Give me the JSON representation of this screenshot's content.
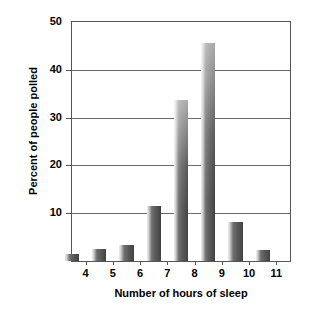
{
  "chart_data": {
    "type": "bar",
    "title": "",
    "xlabel": "Number of hours of sleep",
    "ylabel": "Percent of people polled",
    "categories": [
      "4",
      "5",
      "6",
      "7",
      "8",
      "9",
      "10",
      "11"
    ],
    "values": [
      1.5,
      2.5,
      3.3,
      11.5,
      33.6,
      45.7,
      8.2,
      2.2
    ],
    "series": [
      {
        "name": "Percent of people polled",
        "values": [
          1.5,
          2.5,
          3.3,
          11.5,
          33.6,
          45.7,
          8.2,
          2.2
        ]
      }
    ],
    "xlim": [
      3.5,
      11.5
    ],
    "ylim": [
      0,
      50
    ],
    "ytick_labels": [
      "10",
      "20",
      "30",
      "40",
      "50"
    ],
    "ytick_values": [
      10,
      20,
      30,
      40,
      50
    ],
    "xtick_labels": [
      "4",
      "5",
      "6",
      "7",
      "8",
      "9",
      "10",
      "11"
    ],
    "xtick_values": [
      4,
      5,
      6,
      7,
      8,
      9,
      10,
      11
    ],
    "grid": "horizontal",
    "legend": "none",
    "bar_gradient_light": "#efefef",
    "bar_gradient_dark": "#3f3f3f",
    "axis_color": "#555555",
    "gridline_color": "#6a6a6a",
    "text_color": "#000000",
    "background_color": "#ffffff"
  }
}
